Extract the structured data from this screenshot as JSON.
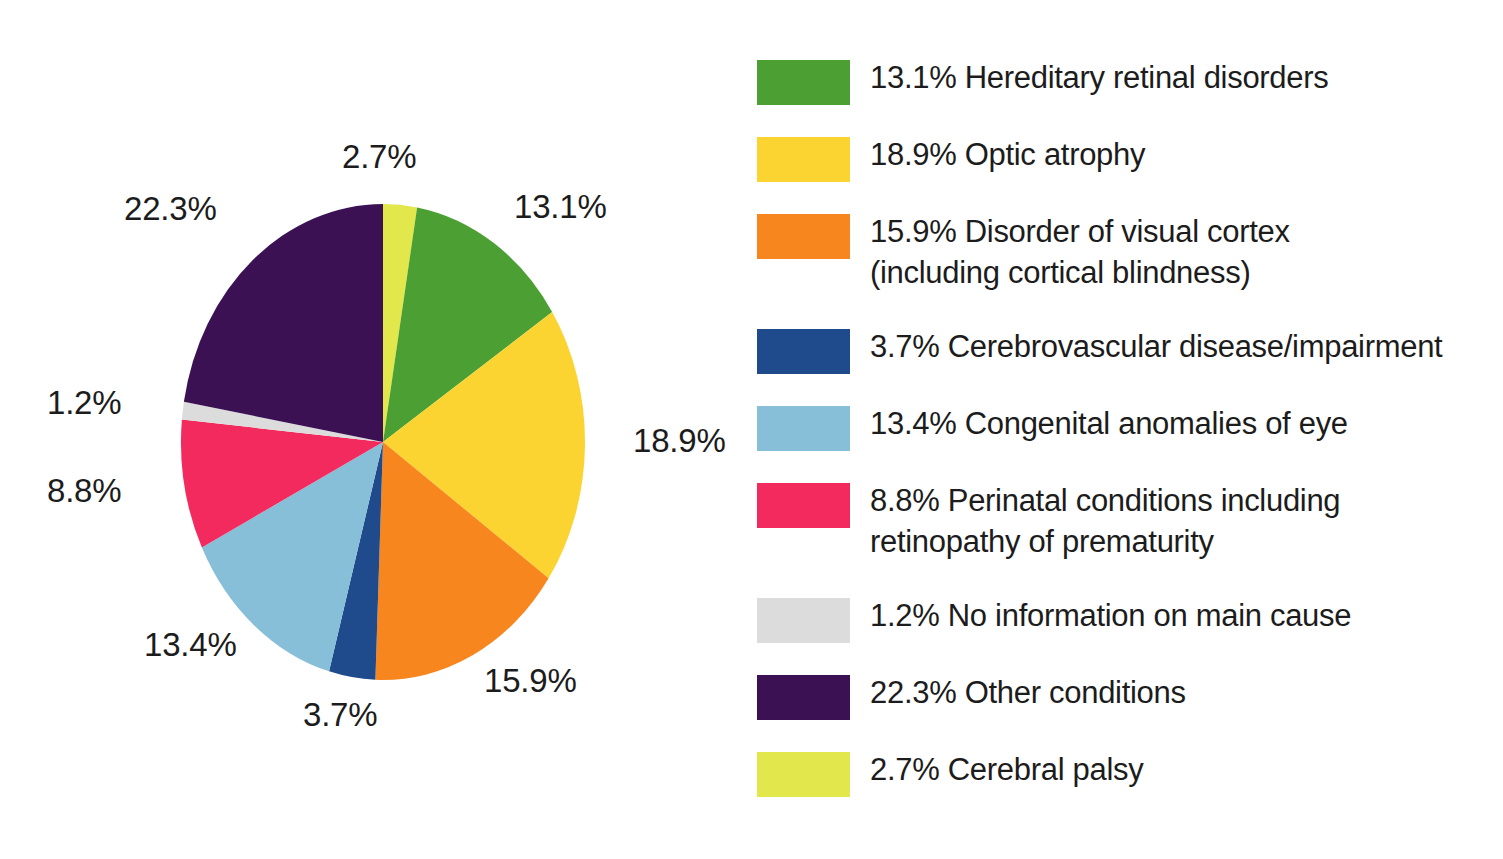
{
  "chart_data": {
    "type": "pie",
    "title": "",
    "subtitle": "",
    "xlabel": "",
    "ylabel": "",
    "legend_position": "right",
    "grid": false,
    "start_angle_deg": 0,
    "direction": "clockwise",
    "units": "percent",
    "total": 100.0,
    "labels": [
      "Cerebral palsy",
      "Hereditary retinal disorders",
      "Optic atrophy",
      "Disorder of visual cortex (including cortical blindness)",
      "Cerebrovascular disease/impairment",
      "Congenital anomalies of eye",
      "Perinatal conditions including retinopathy of prematurity",
      "No information on main cause",
      "Other conditions"
    ],
    "values": [
      2.7,
      13.1,
      18.9,
      15.9,
      3.7,
      13.4,
      8.8,
      1.2,
      22.3
    ],
    "colors": [
      "#E2E74B",
      "#4CA033",
      "#FBD431",
      "#F7861F",
      "#1F4A8C",
      "#87BFD8",
      "#F22A5E",
      "#DCDCDC",
      "#3B1154"
    ],
    "slices": [
      {
        "label": "Cerebral palsy",
        "value": 2.7,
        "display": "2.7%",
        "color": "#E2E74B"
      },
      {
        "label": "Hereditary retinal disorders",
        "value": 13.1,
        "display": "13.1%",
        "color": "#4CA033"
      },
      {
        "label": "Optic atrophy",
        "value": 18.9,
        "display": "18.9%",
        "color": "#FBD431"
      },
      {
        "label": "Disorder of visual cortex (including cortical blindness)",
        "value": 15.9,
        "display": "15.9%",
        "color": "#F7861F"
      },
      {
        "label": "Cerebrovascular disease/impairment",
        "value": 3.7,
        "display": "3.7%",
        "color": "#1F4A8C"
      },
      {
        "label": "Congenital anomalies of eye",
        "value": 13.4,
        "display": "13.4%",
        "color": "#87BFD8"
      },
      {
        "label": "Perinatal conditions including retinopathy of prematurity",
        "value": 8.8,
        "display": "8.8%",
        "color": "#F22A5E"
      },
      {
        "label": "No information on main cause",
        "value": 1.2,
        "display": "1.2%",
        "color": "#DCDCDC"
      },
      {
        "label": "Other conditions",
        "value": 22.3,
        "display": "22.3%",
        "color": "#3B1154"
      }
    ]
  },
  "pie": {
    "callout_labels": {
      "cerebral_palsy": "2.7%",
      "hereditary_retinal_disorders": "13.1%",
      "optic_atrophy": "18.9%",
      "disorder_of_visual_cortex": "15.9%",
      "cerebrovascular_disease": "3.7%",
      "congenital_anomalies_of_eye": "13.4%",
      "perinatal_conditions": "8.8%",
      "no_information": "1.2%",
      "other_conditions": "22.3%"
    }
  },
  "legend": {
    "items": [
      {
        "swatch_color": "#4CA033",
        "text": "13.1% Hereditary retinal disorders"
      },
      {
        "swatch_color": "#FBD431",
        "text": "18.9% Optic atrophy"
      },
      {
        "swatch_color": "#F7861F",
        "text": "15.9% Disorder of visual cortex\n(including cortical blindness)"
      },
      {
        "swatch_color": "#1F4A8C",
        "text": "3.7% Cerebrovascular disease/impairment"
      },
      {
        "swatch_color": "#87BFD8",
        "text": "13.4% Congenital anomalies of eye"
      },
      {
        "swatch_color": "#F22A5E",
        "text": "8.8% Perinatal conditions including\nretinopathy of prematurity"
      },
      {
        "swatch_color": "#DCDCDC",
        "text": "1.2% No information on main cause"
      },
      {
        "swatch_color": "#3B1154",
        "text": "22.3% Other conditions"
      },
      {
        "swatch_color": "#E2E74B",
        "text": "2.7% Cerebral palsy"
      }
    ]
  },
  "colors": {
    "background": "#FFFFFF",
    "text": "#1C1C1C"
  }
}
